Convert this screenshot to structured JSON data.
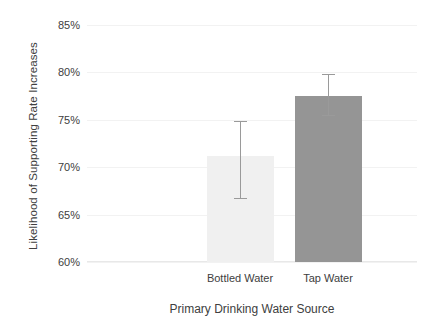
{
  "chart_data": {
    "type": "bar",
    "title": "",
    "xlabel": "Primary Drinking Water Source",
    "ylabel": "Likelihood of Supporting Rate Increases",
    "categories": [
      "Bottled Water",
      "Tap Water"
    ],
    "values": [
      71.2,
      77.5
    ],
    "value_labels": [
      "71.2%",
      "77.5%"
    ],
    "error_low": [
      66.6,
      75.4
    ],
    "error_high": [
      74.9,
      79.8
    ],
    "error_margins": [
      4.2,
      2.2
    ],
    "ylim": [
      60,
      85
    ],
    "ytick_labels": [
      "60%",
      "65%",
      "70%",
      "75%",
      "80%",
      "85%"
    ],
    "ytick_values": [
      60,
      65,
      70,
      75,
      80,
      85
    ],
    "grid": true,
    "legend": "none",
    "unit": "%",
    "colors": {
      "bar_bottled": "#f0f0f0",
      "bar_tap": "#959595",
      "gridline": "#f2f2f2",
      "axis": "#e8e8e8",
      "errorbar": "#9a9a9a",
      "text": "#404040",
      "background": "#ffffff"
    }
  }
}
